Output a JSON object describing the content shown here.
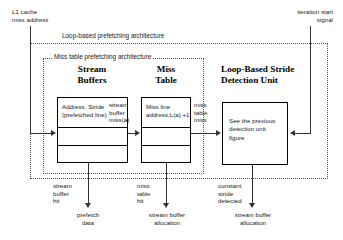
{
  "figure": {
    "inputs": {
      "left": "L1 cache\nmiss address",
      "right": "iteration start\nsignal"
    },
    "frames": {
      "outer": "Loop-based prefetching architecture",
      "inner": "Miss table prefetching architecture"
    },
    "units": [
      {
        "id": "stream-buffers",
        "title": "Stream\nBuffers",
        "rows": [
          "Address, Stride\n(prefetched line)",
          "",
          ""
        ]
      },
      {
        "id": "miss-table",
        "title": "Miss\nTable",
        "rows": [
          "Miss line\naddress,L(a) +1",
          "",
          ""
        ]
      },
      {
        "id": "loop-based-stride-detection-unit",
        "title": "Loop-Based Stride\nDetection Unit",
        "rows": [
          "See the previous\ndetection unit\nfigure"
        ]
      }
    ],
    "edge_labels": {
      "stream_buffer_miss": "stream\nbuffer\nmiss(a)",
      "miss_table_miss": "miss\ntable\nmiss",
      "stream_buffer_hit": "stream\nbuffer\nhit",
      "miss_table_hit": "miss\ntable\nhit",
      "constant_stride_detected": "constant\nstride\ndetected"
    },
    "outputs": [
      "prefetch\ndata",
      "stream buffer\nallocation",
      "stream buffer\nallocation"
    ],
    "colors": {
      "stroke": "#000000",
      "dotted": "#555555",
      "text": "#1a1a1a",
      "background": "#ffffff"
    }
  }
}
